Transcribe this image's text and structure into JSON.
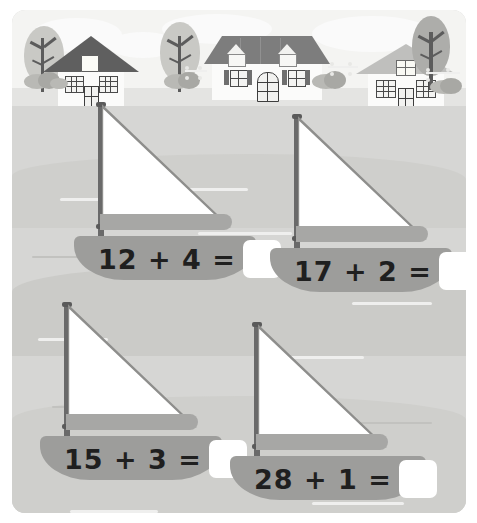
{
  "worksheet": {
    "title": "Sailboat Addition Worksheet",
    "subject": "addition",
    "scene": "harbour town with sailboats",
    "colors": {
      "page_background": "#ffffff",
      "sky": "#f4f4f2",
      "ground": "#e4e4e2",
      "water": "#d6d6d4",
      "hull": "#9d9d9b",
      "sail": "#ffffff",
      "mast": "#6a6a6a",
      "text": "#1f1f1f",
      "answer_box": "#ffffff"
    }
  },
  "problems": [
    {
      "id": "problem-1",
      "addend_a": "12",
      "operator": "+",
      "addend_b": "4",
      "equals": "=",
      "expression": "12 + 4 =",
      "answer": ""
    },
    {
      "id": "problem-2",
      "addend_a": "17",
      "operator": "+",
      "addend_b": "2",
      "equals": "=",
      "expression": "17 + 2 =",
      "answer": ""
    },
    {
      "id": "problem-3",
      "addend_a": "15",
      "operator": "+",
      "addend_b": "3",
      "equals": "=",
      "expression": "15 + 3 =",
      "answer": ""
    },
    {
      "id": "problem-4",
      "addend_a": "28",
      "operator": "+",
      "addend_b": "1",
      "equals": "=",
      "expression": "28 + 1 =",
      "answer": ""
    }
  ],
  "scenery": {
    "houses": [
      {
        "name": "house-left",
        "roof": "dark-gable",
        "features": "attic window, two grid windows, door"
      },
      {
        "name": "house-center",
        "roof": "wide-hip",
        "features": "two dormers, arched door, shuttered windows"
      },
      {
        "name": "house-right",
        "roof": "light-gable",
        "features": "attic window, two grid windows, door"
      }
    ],
    "trees": [
      "tree-left",
      "tree-center",
      "tree-right"
    ],
    "clouds": [
      "cloud-1",
      "cloud-2",
      "cloud-3"
    ]
  }
}
